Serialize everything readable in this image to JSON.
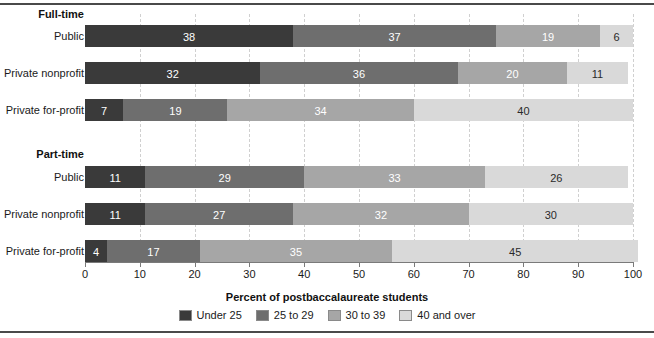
{
  "rules": {
    "top": true,
    "bottom": true
  },
  "axis_title": "Percent of postbaccalaureate students",
  "chart_data": {
    "type": "bar",
    "orientation": "horizontal",
    "stacked": true,
    "stack_total": 100,
    "title": "",
    "subtitle": "",
    "xlabel": "Percent of postbaccalaureate students",
    "ylabel": "",
    "xlim": [
      0,
      100
    ],
    "xticks": [
      0,
      10,
      20,
      30,
      40,
      50,
      60,
      70,
      80,
      90,
      100
    ],
    "xticklabels": [
      "0",
      "10",
      "20",
      "30",
      "40",
      "50",
      "60",
      "70",
      "80",
      "90",
      "100"
    ],
    "grid": "vertical-dashed",
    "legend_position": "bottom-center",
    "series": [
      {
        "name": "Under 25",
        "color": "#3a3a3a",
        "values": [
          38,
          32,
          7,
          11,
          11,
          4
        ]
      },
      {
        "name": "25 to 29",
        "color": "#6e6e6e",
        "values": [
          37,
          36,
          19,
          29,
          27,
          17
        ]
      },
      {
        "name": "30 to 39",
        "color": "#a6a6a6",
        "values": [
          19,
          20,
          34,
          33,
          32,
          35
        ]
      },
      {
        "name": "40 and over",
        "color": "#d9d9d9",
        "values": [
          6,
          11,
          40,
          26,
          30,
          45
        ]
      }
    ],
    "groups": [
      {
        "label": "Full-time",
        "categories": [
          {
            "label": "Public",
            "values": [
              38,
              37,
              19,
              6
            ]
          },
          {
            "label": "Private nonprofit",
            "values": [
              32,
              36,
              20,
              11
            ]
          },
          {
            "label": "Private for-profit",
            "values": [
              7,
              19,
              34,
              40
            ]
          }
        ]
      },
      {
        "label": "Part-time",
        "categories": [
          {
            "label": "Public",
            "values": [
              11,
              29,
              33,
              26
            ]
          },
          {
            "label": "Private nonprofit",
            "values": [
              11,
              27,
              32,
              30
            ]
          },
          {
            "label": "Private for-profit",
            "values": [
              4,
              17,
              35,
              45
            ]
          }
        ]
      }
    ]
  },
  "legend": {
    "items": [
      {
        "label": "Under 25",
        "color": "#3a3a3a"
      },
      {
        "label": "25 to 29",
        "color": "#6e6e6e"
      },
      {
        "label": "30 to 39",
        "color": "#a6a6a6"
      },
      {
        "label": "40 and over",
        "color": "#d9d9d9"
      }
    ]
  }
}
